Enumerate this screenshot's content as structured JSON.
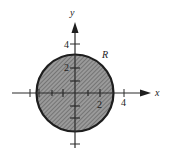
{
  "diagram": {
    "region_label": "R",
    "x_axis_label": "x",
    "y_axis_label": "y",
    "x_tick_labels": {
      "two": "2",
      "four": "4"
    },
    "y_tick_labels": {
      "two": "2",
      "four": "4"
    },
    "region": {
      "shape": "disk",
      "center": [
        0,
        0
      ],
      "radius": 3,
      "fill": "hatched-gray"
    },
    "ticks": [
      -4,
      -3,
      -2,
      -1,
      1,
      2,
      3,
      4
    ],
    "colors": {
      "ink": "#222222",
      "fill": "#8a8a8a",
      "background": "#ffffff"
    }
  }
}
